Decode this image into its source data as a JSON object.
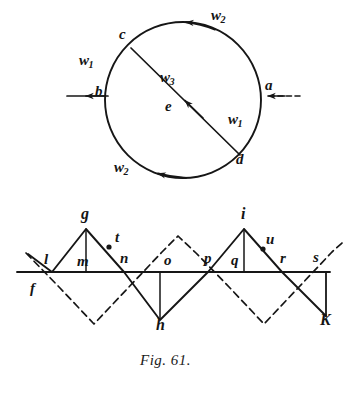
{
  "figure": {
    "caption": "Fig. 61.",
    "number": "61"
  },
  "circle_diagram": {
    "name": "circle-velocity-diagram",
    "center_label": "e",
    "points": [
      {
        "id": "a",
        "label": "a",
        "x": 268,
        "y": 86
      },
      {
        "id": "b",
        "label": "b",
        "x": 97,
        "y": 92
      },
      {
        "id": "c",
        "label": "c",
        "x": 122,
        "y": 36
      },
      {
        "id": "d",
        "label": "d",
        "x": 239,
        "y": 160
      },
      {
        "id": "e",
        "label": "e",
        "x": 178,
        "y": 107
      }
    ],
    "vector_labels": [
      {
        "id": "w2-top",
        "base": "w",
        "sub": "2",
        "x": 215,
        "y": 15
      },
      {
        "id": "w1-left",
        "base": "w",
        "sub": "1",
        "x": 83,
        "y": 61
      },
      {
        "id": "w3-center",
        "base": "w",
        "sub": "3",
        "x": 165,
        "y": 78
      },
      {
        "id": "w1-right",
        "base": "w",
        "sub": "1",
        "x": 233,
        "y": 119
      },
      {
        "id": "w2-bottom",
        "base": "w",
        "sub": "2",
        "x": 119,
        "y": 167
      }
    ],
    "arrows": [
      {
        "id": "inflow-right",
        "style": "dashed",
        "direction": "left"
      },
      {
        "id": "outflow-left",
        "style": "solid",
        "direction": "left"
      },
      {
        "id": "arc-top",
        "style": "solid",
        "direction": "counterclockwise"
      },
      {
        "id": "arc-bottom",
        "style": "solid",
        "direction": "counterclockwise"
      },
      {
        "id": "chord-cd",
        "style": "solid",
        "direction": "up-left"
      }
    ]
  },
  "zigzag_diagram": {
    "name": "zigzag-blade-diagram",
    "points": [
      {
        "id": "f",
        "label": "f",
        "x": 33,
        "y": 289
      },
      {
        "id": "l",
        "label": "l",
        "x": 46,
        "y": 260
      },
      {
        "id": "g",
        "label": "g",
        "x": 86,
        "y": 216
      },
      {
        "id": "m",
        "label": "m",
        "x": 82,
        "y": 262
      },
      {
        "id": "t",
        "label": "t",
        "x": 117,
        "y": 238
      },
      {
        "id": "n",
        "label": "n",
        "x": 123,
        "y": 259
      },
      {
        "id": "o",
        "label": "o",
        "x": 167,
        "y": 261
      },
      {
        "id": "p",
        "label": "p",
        "x": 207,
        "y": 259
      },
      {
        "id": "h",
        "label": "h",
        "x": 160,
        "y": 325
      },
      {
        "id": "i",
        "label": "i",
        "x": 244,
        "y": 216
      },
      {
        "id": "q",
        "label": "q",
        "x": 234,
        "y": 261
      },
      {
        "id": "u",
        "label": "u",
        "x": 268,
        "y": 240
      },
      {
        "id": "r",
        "label": "r",
        "x": 283,
        "y": 259
      },
      {
        "id": "s",
        "label": "s",
        "x": 316,
        "y": 258
      },
      {
        "id": "K",
        "label": "K",
        "x": 323,
        "y": 320
      }
    ],
    "marker_dots": [
      "t",
      "u"
    ],
    "baseline_y": 272,
    "solid_path": "l-g-n-h-p-i-r-K",
    "dashed_path": "f-through-crossing-zigzag"
  }
}
